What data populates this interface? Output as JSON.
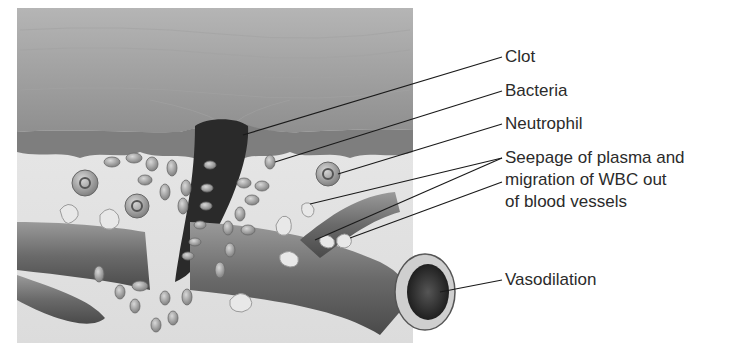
{
  "figure": {
    "title": "",
    "labels": {
      "clot": "Clot",
      "bacteria": "Bacteria",
      "neutrophil": "Neutrophil",
      "seepage_line1": "Seepage of plasma and",
      "seepage_line2": "migration of WBC out",
      "seepage_line3": "of blood vessels",
      "vasodilation": "Vasodilation"
    },
    "colors": {
      "background": "#ffffff",
      "epidermis": "#9a9a9a",
      "dermis": "#e6e6e6",
      "clot": "#2a2a2a",
      "vessel": "#6e6e6e",
      "cells": "#8c8c8c",
      "text": "#2b2b2b",
      "leader_lines": "#1a1a1a"
    }
  }
}
